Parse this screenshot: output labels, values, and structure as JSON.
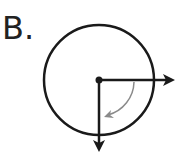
{
  "diagram": {
    "label": "B.",
    "circle": {
      "cx": 99,
      "cy": 80,
      "r": 55
    },
    "vectors": [
      {
        "name": "horizontal-right",
        "from": [
          99,
          80
        ],
        "to": [
          175,
          80
        ]
      },
      {
        "name": "vertical-down",
        "from": [
          99,
          80
        ],
        "to": [
          99,
          151
        ]
      }
    ],
    "rotation_arrow": {
      "direction": "clockwise",
      "from_angle_deg": 0,
      "to_angle_deg": 90,
      "color": "#8a8a8a"
    },
    "colors": {
      "stroke": "#1a1a1a",
      "rotation": "#8a8a8a"
    }
  }
}
